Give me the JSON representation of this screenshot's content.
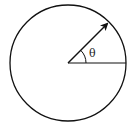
{
  "diagram": {
    "angle_label": "θ",
    "stroke_color": "#111111",
    "background": "#ffffff"
  }
}
